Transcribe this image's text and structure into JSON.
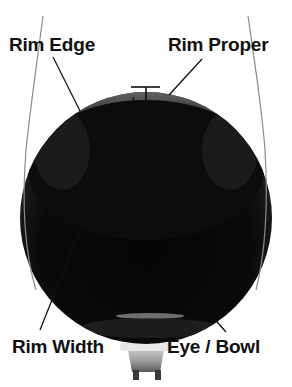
{
  "diagram": {
    "colors": {
      "background": "#ffffff",
      "sphere_dark": "#0b0b0b",
      "sphere_cap_light": "#8a8a8a",
      "outline_lines": "#8c8c8c",
      "leader_lines": "#111111",
      "label_text": "#111111"
    },
    "labels": {
      "rim_edge": "Rim Edge",
      "rim_proper": "Rim Proper",
      "rim_width": "Rim Width",
      "eye_bowl": "Eye / Bowl"
    }
  }
}
